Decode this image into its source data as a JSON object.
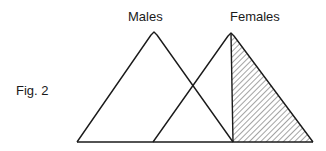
{
  "figure": {
    "caption": "Fig. 2",
    "labels": {
      "males": "Males",
      "females": "Females"
    },
    "shapes": {
      "males_triangle": {
        "base_left_x": 77,
        "peak_x": 154,
        "base_right_x": 233,
        "peak_y": 33,
        "base_y": 142
      },
      "females_triangle": {
        "base_left_x": 153,
        "peak_x": 231,
        "base_right_x": 313,
        "peak_y": 33,
        "base_y": 142
      },
      "shaded_region": "right half of females triangle (diagonal hatching)"
    },
    "colors": {
      "line": "#1a1a1a",
      "background": "#ffffff"
    }
  }
}
